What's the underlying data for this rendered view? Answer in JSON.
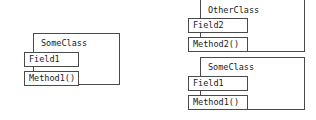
{
  "diagram": {
    "kind": "uml-class-diagram",
    "background_color": "#ffffff",
    "line_color": "#4a4a4a",
    "text_color": "#1a1a1a",
    "classes": [
      {
        "id": "left-someclass",
        "name": "SomeClass",
        "fields": [
          "Field1"
        ],
        "methods": [
          "Method1()"
        ]
      },
      {
        "id": "right-otherclass",
        "name": "OtherClass",
        "fields": [
          "Field2"
        ],
        "methods": [
          "Method2()"
        ]
      },
      {
        "id": "right-someclass",
        "name": "SomeClass",
        "fields": [
          "Field1"
        ],
        "methods": [
          "Method1()"
        ]
      }
    ]
  }
}
